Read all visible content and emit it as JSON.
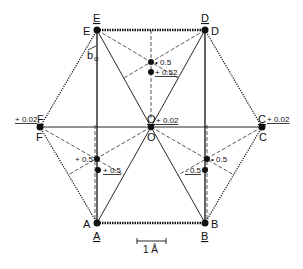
{
  "diagram": {
    "points": {
      "E": {
        "label": "E",
        "label_under": "E"
      },
      "D": {
        "label": "D",
        "label_under": "D"
      },
      "F": {
        "label": "F",
        "label_under": "F"
      },
      "C": {
        "label": "C",
        "label_under": "C"
      },
      "A": {
        "label": "A",
        "label_under": "A"
      },
      "B": {
        "label": "B",
        "label_under": "B"
      },
      "O": {
        "label": "O",
        "label_under": "O"
      }
    },
    "vector_label": "b",
    "vector_subscript": "o",
    "annotations": {
      "top_upper": "• 0.5",
      "top_lower": "+ 0.52",
      "center": "+ 0.02",
      "left_f": "+ 0.02",
      "right_c": "+ 0.02",
      "left_upper": "+ 0.5",
      "left_lower": "+ 0.5",
      "right_upper": "• 0.5",
      "right_lower": "- 0.5"
    },
    "scale_bar": "1 Å",
    "colors": {
      "line": "#111111",
      "background": "#ffffff"
    }
  }
}
